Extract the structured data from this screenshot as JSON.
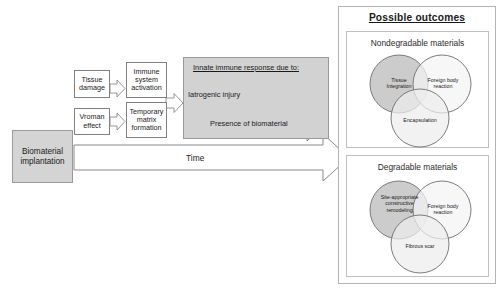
{
  "figure": {
    "left_flow": {
      "source_box": {
        "label": "Biomaterial implantation"
      },
      "stage1": [
        {
          "label": "Tissue damage"
        },
        {
          "label": "Vroman effect"
        }
      ],
      "stage2": [
        {
          "label": "Immune system activation"
        },
        {
          "label": "Temporary matrix formation"
        }
      ],
      "innate_panel": {
        "title": "Innate immune response due to:",
        "arrows": [
          {
            "label": "Iatrogenic injury"
          },
          {
            "label": "Presence of biomaterial"
          }
        ]
      },
      "time_arrow": {
        "label": "Time"
      }
    },
    "outcomes": {
      "title": "Possible outcomes",
      "groups": [
        {
          "title": "Nondegradable materials",
          "circles": [
            {
              "label": "Tissue Integration",
              "fill": "#c9c9c9"
            },
            {
              "label": "Foreign body reaction",
              "fill": "#f2f2f2"
            },
            {
              "label": "Encapsulation",
              "fill": "#ededed"
            }
          ]
        },
        {
          "title": "Degradable materials",
          "circles": [
            {
              "label": "Site-appropriate constructive remodeling",
              "fill": "#c9c9c9"
            },
            {
              "label": "Foreign body reaction",
              "fill": "#f2f2f2"
            },
            {
              "label": "Fibrous scar",
              "fill": "#ededed"
            }
          ]
        }
      ]
    },
    "colors": {
      "box_gray_fill": "#d4d4d4",
      "panel_gray_fill": "#d2d2d2",
      "outline": "#808080",
      "arrow_fill": "#ffffff",
      "venn_dark": "#c9c9c9",
      "venn_light": "#f2f2f2"
    }
  }
}
